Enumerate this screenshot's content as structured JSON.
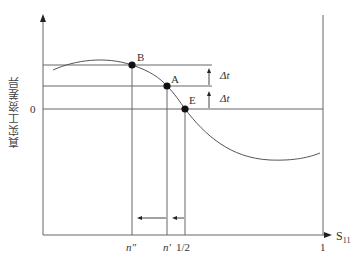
{
  "diagram": {
    "y_axis_label": "真实工资差异",
    "x_axis_label": "S",
    "x_axis_label_subscript": "11",
    "y_zero_label": "0",
    "x_ticks": [
      {
        "label": "n″",
        "x": 132
      },
      {
        "label": "n′",
        "x": 167
      },
      {
        "label": "1/2",
        "x": 185
      },
      {
        "label": "1",
        "x": 323
      }
    ],
    "points": [
      {
        "label": "B",
        "x": 132,
        "y": 65
      },
      {
        "label": "A",
        "x": 167,
        "y": 86
      },
      {
        "label": "E",
        "x": 185,
        "y": 109
      }
    ],
    "delta_labels": [
      "Δt",
      "Δt"
    ],
    "colors": {
      "line": "#666666",
      "curve": "#555555",
      "point": "#111111",
      "text": "#333333"
    }
  }
}
